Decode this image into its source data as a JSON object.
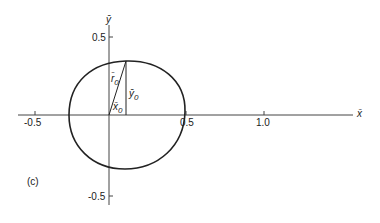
{
  "figure": {
    "panel_label": "(c)",
    "axes": {
      "x_label": "x̄",
      "y_label": "ȳ",
      "x_ticks": [
        "-0.5",
        "0.5",
        "1.0"
      ],
      "y_ticks": [
        "0.5",
        "-0.5"
      ]
    },
    "annotations": {
      "r0": "r̄",
      "r0_sub": "0",
      "y0": "ȳ",
      "y0_sub": "0",
      "x0": "x̄",
      "x0_sub": "0"
    },
    "colors": {
      "ink": "#222222",
      "axis": "#444444",
      "background": "#ffffff"
    }
  }
}
